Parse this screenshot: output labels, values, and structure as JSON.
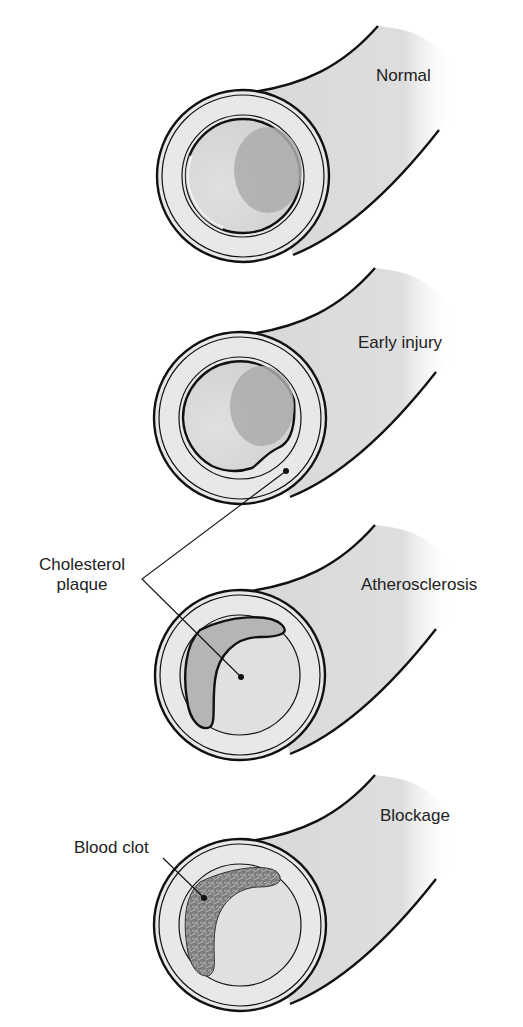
{
  "diagram": {
    "type": "medical-illustration",
    "stages": [
      {
        "id": "normal",
        "label": "Normal",
        "cy": 176,
        "label_x": 376,
        "label_y": 66
      },
      {
        "id": "early-injury",
        "label": "Early injury",
        "cy": 418,
        "label_x": 358,
        "label_y": 336
      },
      {
        "id": "atherosclerosis",
        "label": "Atherosclerosis",
        "cy": 675,
        "label_x": 361,
        "label_y": 575
      },
      {
        "id": "blockage",
        "label": "Blockage",
        "cy": 925,
        "label_x": 380,
        "label_y": 806
      }
    ],
    "callouts": {
      "cholesterol_plaque": {
        "line1": "Cholesterol",
        "line2": "plaque"
      },
      "blood_clot": {
        "label": "Blood clot"
      }
    },
    "colors": {
      "outline": "#111111",
      "vessel_wall": "#e6e6e6",
      "tube_fill": "#dcdcdc",
      "lumen": "#d2d2d2",
      "lumen_shadow": "#a9a9a9",
      "plaque": "#b3b3b3",
      "clot": "#7a7a7a",
      "text": "#222222"
    }
  }
}
